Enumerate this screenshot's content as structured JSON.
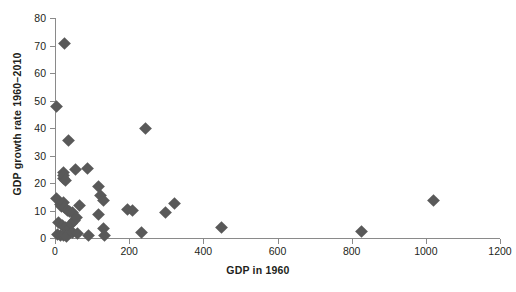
{
  "chart_data": {
    "type": "scatter",
    "title": "",
    "xlabel": "GDP in 1960",
    "ylabel": "GDP growth rate 1960–2010",
    "xlim": [
      0,
      1200
    ],
    "ylim": [
      0,
      80
    ],
    "xticks": [
      0,
      200,
      400,
      600,
      800,
      1000,
      1200
    ],
    "yticks": [
      0,
      10,
      20,
      30,
      40,
      50,
      60,
      70,
      80
    ],
    "xtick_labels": [
      "0",
      "200",
      "400",
      "600",
      "800",
      "1000",
      "1200"
    ],
    "ytick_labels": [
      "0",
      "10",
      "20",
      "30",
      "40",
      "50",
      "60",
      "70",
      "80"
    ],
    "grid": false,
    "legend": false,
    "marker": "diamond",
    "marker_color": "#595959",
    "axis_color": "#8a8a8a",
    "points": [
      [
        26,
        70.8
      ],
      [
        4,
        48.0
      ],
      [
        36,
        35.3
      ],
      [
        244,
        39.7
      ],
      [
        22,
        24.0
      ],
      [
        22,
        21.8
      ],
      [
        24,
        22.6
      ],
      [
        27,
        20.9
      ],
      [
        56,
        25.0
      ],
      [
        88,
        25.2
      ],
      [
        118,
        18.6
      ],
      [
        124,
        15.3
      ],
      [
        130,
        13.7
      ],
      [
        5,
        14.3
      ],
      [
        14,
        12.2
      ],
      [
        18,
        11.6
      ],
      [
        24,
        12.9
      ],
      [
        26,
        11.2
      ],
      [
        34,
        10.1
      ],
      [
        40,
        9.6
      ],
      [
        46,
        9.4
      ],
      [
        66,
        12.0
      ],
      [
        118,
        8.6
      ],
      [
        196,
        10.2
      ],
      [
        210,
        10.1
      ],
      [
        298,
        9.2
      ],
      [
        322,
        12.4
      ],
      [
        1020,
        13.5
      ],
      [
        10,
        5.6
      ],
      [
        20,
        4.6
      ],
      [
        28,
        4.0
      ],
      [
        36,
        3.1
      ],
      [
        44,
        5.1
      ],
      [
        52,
        6.5
      ],
      [
        58,
        7.3
      ],
      [
        130,
        3.6
      ],
      [
        8,
        1.4
      ],
      [
        14,
        0.8
      ],
      [
        24,
        1.0
      ],
      [
        32,
        0.6
      ],
      [
        48,
        2.0
      ],
      [
        62,
        1.8
      ],
      [
        90,
        0.8
      ],
      [
        134,
        0.8
      ],
      [
        232,
        2.0
      ],
      [
        448,
        3.8
      ],
      [
        826,
        2.3
      ]
    ]
  }
}
